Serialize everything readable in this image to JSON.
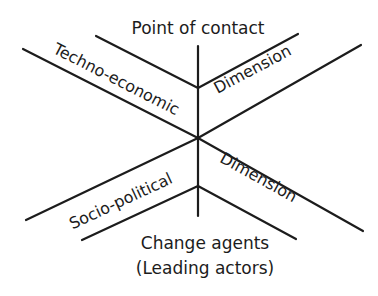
{
  "diagram": {
    "type": "cross-diagram",
    "top_label": "Point of contact",
    "bottom_label_line1": "Change agents",
    "bottom_label_line2": "(Leading actors)",
    "arms": {
      "upper_left": "Techno-economic",
      "upper_right": "Dimension",
      "lower_left": "Socio-political",
      "lower_right": "Dimension"
    },
    "colors": {
      "line": "#1c1c1c",
      "text": "#1c1c1c",
      "background": "#ffffff"
    }
  }
}
